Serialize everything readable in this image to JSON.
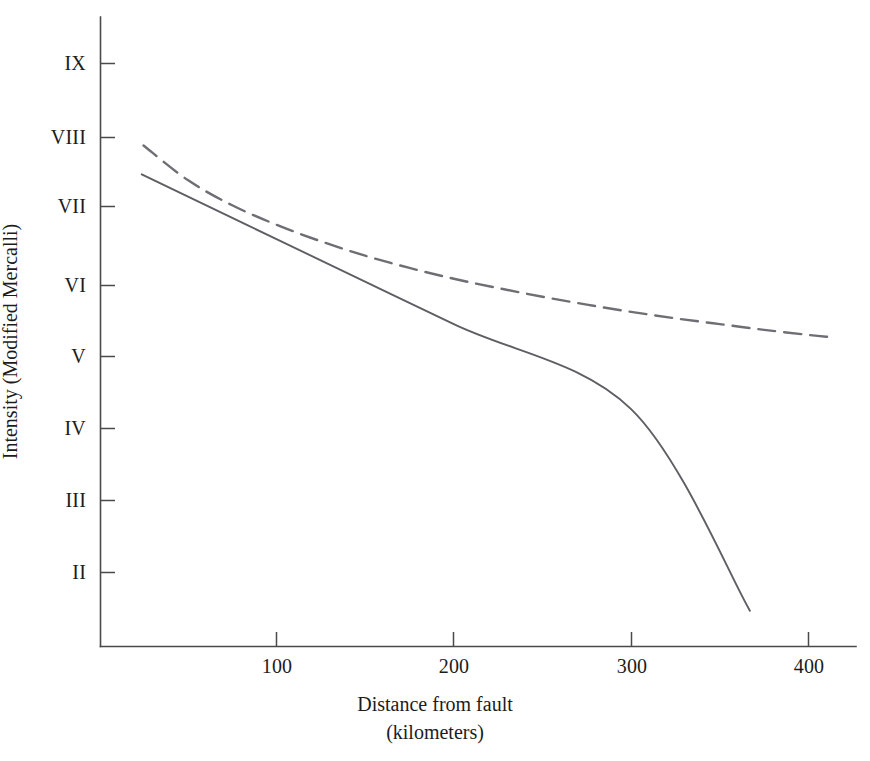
{
  "chart_data": {
    "type": "line",
    "title": "",
    "xlabel": "Distance from fault",
    "xlabel_units": "(kilometers)",
    "ylabel": "Intensity (Modified Mercalli)",
    "xlim": [
      0,
      425
    ],
    "ylim_labels": [
      "II",
      "III",
      "IV",
      "V",
      "VI",
      "VII",
      "VIII",
      "IX"
    ],
    "grid": false,
    "legend": null,
    "x_ticks": [
      {
        "value": 100,
        "label": "100"
      },
      {
        "value": 200,
        "label": "200"
      },
      {
        "value": 300,
        "label": "300"
      },
      {
        "value": 400,
        "label": "400"
      }
    ],
    "y_ticks": [
      {
        "value": 2,
        "label": "II"
      },
      {
        "value": 3,
        "label": "III"
      },
      {
        "value": 4,
        "label": "IV"
      },
      {
        "value": 5,
        "label": "V"
      },
      {
        "value": 6,
        "label": "VI"
      },
      {
        "value": 7,
        "label": "VII"
      },
      {
        "value": 8,
        "label": "VIII"
      },
      {
        "value": 9,
        "label": "IX"
      }
    ],
    "series": [
      {
        "name": "dashed-attenuation-curve",
        "style": "dashed",
        "color": "#6e6e74",
        "points": [
          {
            "x": 25,
            "y": 7.93
          },
          {
            "x": 50,
            "y": 7.45
          },
          {
            "x": 75,
            "y": 7.1
          },
          {
            "x": 100,
            "y": 6.83
          },
          {
            "x": 125,
            "y": 6.6
          },
          {
            "x": 150,
            "y": 6.4
          },
          {
            "x": 175,
            "y": 6.23
          },
          {
            "x": 200,
            "y": 6.08
          },
          {
            "x": 225,
            "y": 5.95
          },
          {
            "x": 250,
            "y": 5.83
          },
          {
            "x": 275,
            "y": 5.72
          },
          {
            "x": 300,
            "y": 5.62
          },
          {
            "x": 325,
            "y": 5.53
          },
          {
            "x": 350,
            "y": 5.45
          },
          {
            "x": 375,
            "y": 5.37
          },
          {
            "x": 400,
            "y": 5.3
          },
          {
            "x": 412,
            "y": 5.27
          }
        ]
      },
      {
        "name": "solid-attenuation-line",
        "style": "solid",
        "color": "#5e5e64",
        "points": [
          {
            "x": 24,
            "y": 7.53
          },
          {
            "x": 100,
            "y": 6.63
          },
          {
            "x": 200,
            "y": 5.45
          },
          {
            "x": 300,
            "y": 4.27
          },
          {
            "x": 367,
            "y": 1.47
          }
        ]
      }
    ]
  },
  "axes": {
    "y_title": "Intensity (Modified Mercalli)",
    "x_title_line1": "Distance from fault",
    "x_title_line2": "(kilometers)",
    "y_tick_labels": [
      "IX",
      "VIII",
      "VII",
      "VI",
      "V",
      "IV",
      "III",
      "II"
    ],
    "x_tick_labels": [
      "100",
      "200",
      "300",
      "400"
    ],
    "axis_color": "#4a4a4a"
  }
}
